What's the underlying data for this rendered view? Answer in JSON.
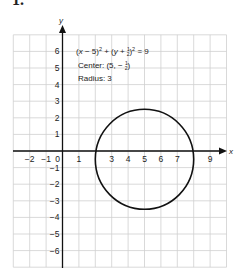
{
  "problem": {
    "number": "1."
  },
  "chart_data": {
    "type": "line",
    "title": "",
    "xlabel": "x",
    "ylabel": "y",
    "xlim": [
      -3,
      10
    ],
    "ylim": [
      -7,
      7
    ],
    "grid": true,
    "x_tick_labels": [
      "−2",
      "−1",
      "0",
      "1",
      "3",
      "4",
      "5",
      "6",
      "7",
      "9"
    ],
    "y_tick_labels": [
      "6",
      "5",
      "4",
      "3",
      "2",
      "1",
      "−1",
      "−2",
      "−3",
      "−4",
      "−5",
      "−6"
    ],
    "series": [
      {
        "name": "circle",
        "shape": "circle",
        "equation": "(x − 5)² + (y + 1/2)² = 9",
        "center": [
          5,
          -0.5
        ],
        "radius": 3
      }
    ],
    "annotations": {
      "equation": "(x − 5)² + (y + ½)² = 9",
      "center_label": "Center: (5, − ½)",
      "radius_label": "Radius: 3"
    }
  },
  "labels": {
    "eq_left": "(",
    "eq_x": "x",
    "eq_mid1": " − 5)",
    "eq_sq": "2",
    "eq_plus": " + (",
    "eq_y": "y",
    "eq_mid2": " + ",
    "eq_num": "1",
    "eq_den": "2",
    "eq_close": ")",
    "eq_tail": " = 9",
    "center_prefix": "Center: (5, − ",
    "center_num": "1",
    "center_den": "2",
    "center_close": ")",
    "radius": "Radius: 3",
    "x_axis": "x",
    "y_axis": "y"
  },
  "colors": {
    "grid": "#cfcfcf",
    "axis": "#111111",
    "curve": "#111111"
  }
}
